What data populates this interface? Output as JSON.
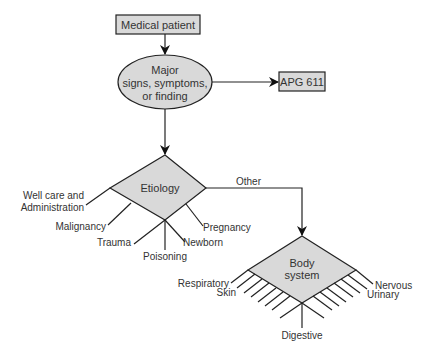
{
  "diagram": {
    "type": "flowchart",
    "colors": {
      "node_fill": "#d9d9d9",
      "stroke": "#222222",
      "text": "#333333",
      "background": "#ffffff"
    },
    "nodes": {
      "start": {
        "label": "Medical patient",
        "shape": "rectangle"
      },
      "decision_major": {
        "lines": [
          "Major",
          "signs, symptoms,",
          "or finding"
        ],
        "shape": "ellipse"
      },
      "apg": {
        "label": "APG 611",
        "shape": "rectangle"
      },
      "etiology": {
        "label": "Etiology",
        "shape": "diamond"
      },
      "body_system": {
        "lines": [
          "Body",
          "system"
        ],
        "shape": "diamond"
      }
    },
    "edges": {
      "other_label": "Other"
    },
    "etiology_branches": {
      "well_care": [
        "Well care and",
        "Administration"
      ],
      "malignancy": "Malignancy",
      "trauma": "Trauma",
      "poisoning": "Poisoning",
      "newborn": "Newborn",
      "pregnancy": "Pregnancy"
    },
    "body_system_branches": {
      "respiratory": "Respiratory",
      "skin": "Skin",
      "digestive": "Digestive",
      "nervous": "Nervous",
      "urinary": "Urinary"
    }
  }
}
